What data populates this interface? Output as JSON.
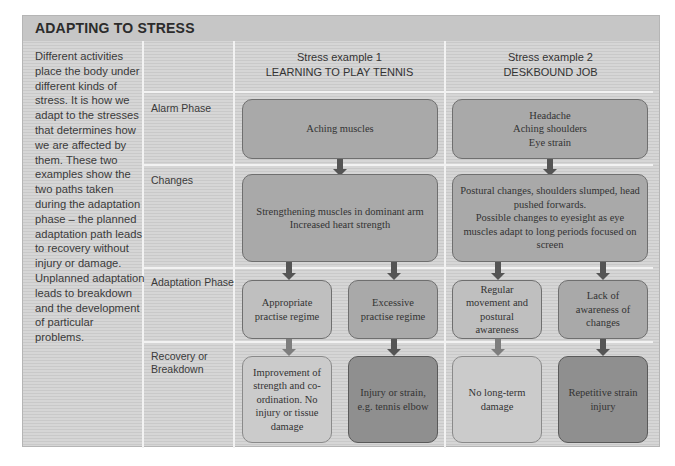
{
  "title": "ADAPTING TO STRESS",
  "intro_text": "Different activities place the body under different kinds of stress. It is how we adapt to the stresses that determines how we are affected by them. These two examples show the two paths taken during the adaptation phase – the planned adaptation path leads to recovery without injury or damage. Unplanned adaptation leads to breakdown and the development of particular problems.",
  "row_labels": {
    "alarm": "Alarm Phase",
    "changes": "Changes",
    "adaptation": "Adaptation Phase",
    "recovery_line1": "Recovery or",
    "recovery_line2": "Breakdown"
  },
  "examples": [
    {
      "heading": "Stress example 1",
      "subheading": "LEARNING TO PLAY TENNIS",
      "alarm": "Aching muscles",
      "changes": "Strengthening muscles in dominant arm\nIncreased heart strength",
      "paths": [
        {
          "adaptation": "Appropriate practise regime",
          "outcome": "Improvement of strength and co-ordination. No injury or tissue damage",
          "type": "planned"
        },
        {
          "adaptation": "Excessive practise regime",
          "outcome": "Injury or strain, e.g. tennis elbow",
          "type": "unplanned"
        }
      ]
    },
    {
      "heading": "Stress example 2",
      "subheading": "DESKBOUND JOB",
      "alarm": "Headache\nAching shoulders\nEye strain",
      "changes": "Postural changes, shoulders slumped, head pushed forwards.\nPossible changes to eyesight as eye muscles adapt to long periods focused on screen",
      "paths": [
        {
          "adaptation": "Regular movement and postural awareness",
          "outcome": "No long-term damage",
          "type": "planned"
        },
        {
          "adaptation": "Lack of awareness of changes",
          "outcome": "Repetitive strain injury",
          "type": "unplanned"
        }
      ]
    }
  ],
  "colors": {
    "frame_bg": "#d3d3d3",
    "box_mid": "#a9a9a9",
    "box_light": "#bfbfbf",
    "box_pale": "#cbcbcb",
    "box_dark": "#8f8f8f",
    "arrow_dark": "#555555",
    "arrow_light": "#7e7e7e"
  }
}
